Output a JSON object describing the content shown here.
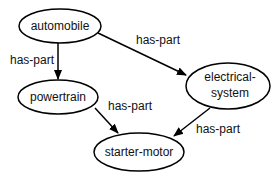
{
  "diagram": {
    "type": "semantic-network",
    "nodes": [
      {
        "id": "automobile",
        "label": "automobile"
      },
      {
        "id": "powertrain",
        "label": "powertrain"
      },
      {
        "id": "electrical-system",
        "label_line1": "electrical-",
        "label_line2": "system"
      },
      {
        "id": "starter-motor",
        "label": "starter-motor"
      }
    ],
    "edges": [
      {
        "from": "automobile",
        "to": "powertrain",
        "label": "has-part"
      },
      {
        "from": "automobile",
        "to": "electrical-system",
        "label": "has-part"
      },
      {
        "from": "powertrain",
        "to": "starter-motor",
        "label": "has-part"
      },
      {
        "from": "electrical-system",
        "to": "starter-motor",
        "label": "has-part"
      }
    ],
    "colors": {
      "stroke": "#000000",
      "background": "#ffffff"
    }
  }
}
